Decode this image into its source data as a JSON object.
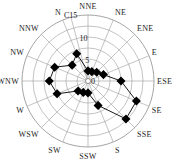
{
  "chart_data": {
    "type": "radar",
    "title": "",
    "axis_label": "C",
    "radial_ticks": [
      0,
      5,
      10,
      15
    ],
    "rmax": 15,
    "grid": true,
    "categories": [
      "NNE",
      "NE",
      "ENE",
      "E",
      "ESE",
      "SE",
      "SSE",
      "S",
      "SSW",
      "SW",
      "WSW",
      "W",
      "WNW",
      "NW",
      "NNW",
      "N"
    ],
    "series": [
      {
        "name": "frequency",
        "values": [
          2.3,
          2.3,
          2.8,
          3.8,
          7.5,
          11.9,
          12.2,
          6.0,
          2.7,
          2.8,
          3.2,
          7.6,
          8.8,
          8.2,
          5.1,
          6.7
        ]
      }
    ],
    "colors": {
      "line": "#000000",
      "grid": "#9a9a9a",
      "marker": "#000000"
    }
  }
}
